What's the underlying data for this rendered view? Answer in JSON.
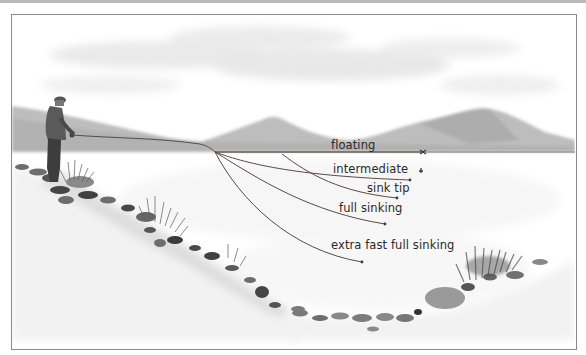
{
  "diagram": {
    "scene": {
      "subject": "angler casting from rocky shore into lake",
      "background": "misty mountains and clouds",
      "colors": {
        "frame_border": "#8a8a8a",
        "line_color": "#5a4a44",
        "text_color": "#2a2a2a",
        "water_surface": "#7b7b7b"
      }
    },
    "labels": {
      "floating": "floating",
      "intermediate": "intermediate",
      "sink_tip": "sink tip",
      "full_sinking": "full sinking",
      "extra_fast_full_sinking": "extra fast full sinking"
    },
    "lines": [
      {
        "name": "floating",
        "end": [
          423,
          152
        ]
      },
      {
        "name": "intermediate",
        "end": [
          410,
          180
        ]
      },
      {
        "name": "sink tip",
        "end": [
          397,
          198
        ]
      },
      {
        "name": "full sinking",
        "end": [
          385,
          224
        ]
      },
      {
        "name": "extra fast full sinking",
        "end": [
          362,
          262
        ]
      }
    ]
  }
}
